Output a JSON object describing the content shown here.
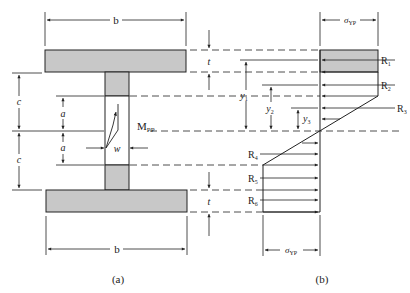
{
  "figure": {
    "panel_a": {
      "caption": "(a)",
      "labels": {
        "flange_width_top": "b",
        "flange_width_bottom": "b",
        "half_depth_top": "c",
        "half_depth_bottom": "c",
        "elastic_core_top": "a",
        "elastic_core_bottom": "a",
        "web_width": "w",
        "moment": "M",
        "moment_sub": "PP",
        "flange_thickness_top": "t",
        "flange_thickness_bottom": "t"
      }
    },
    "panel_b": {
      "caption": "(b)",
      "labels": {
        "stress_top": "σ",
        "stress_top_sub": "YP",
        "stress_bottom": "σ",
        "stress_bottom_sub": "YP",
        "y1": "y",
        "y1_sub": "1",
        "y2": "y",
        "y2_sub": "2",
        "y3": "y",
        "y3_sub": "3"
      },
      "resultants": [
        {
          "name": "R",
          "sub": "1"
        },
        {
          "name": "R",
          "sub": "2"
        },
        {
          "name": "R",
          "sub": "3"
        },
        {
          "name": "R",
          "sub": "4"
        },
        {
          "name": "R",
          "sub": "5"
        },
        {
          "name": "R",
          "sub": "6"
        }
      ]
    },
    "colors": {
      "fill": "#c8c8c8",
      "stroke": "#222222",
      "background": "#ffffff"
    }
  }
}
